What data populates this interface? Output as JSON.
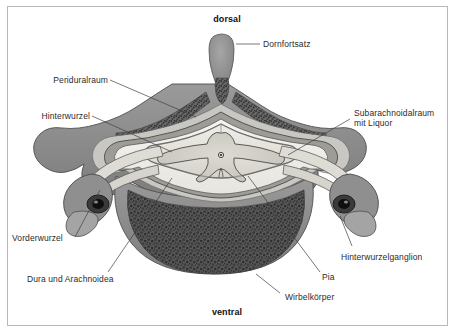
{
  "figure": {
    "type": "anatomical-cross-section",
    "frame_color": "#b8b8b8",
    "background_color": "#ffffff",
    "text_color": "#2b2b2b"
  },
  "orientation": {
    "top_label": "dorsal",
    "bottom_label": "ventral"
  },
  "labels": {
    "dornfortsatz": "Dornfortsatz",
    "periduralraum": "Periduralraum",
    "hinterwurzel": "Hinterwurzel",
    "subarachnoidalraum_line1": "Subarachnoidalraum",
    "subarachnoidalraum_line2": "mit Liquor",
    "vorderwurzel": "Vorderwurzel",
    "dura_und_arachnoidea": "Dura und Arachnoidea",
    "hinterwurzelganglion": "Hinterwurzelganglion",
    "pia": "Pia",
    "wirbelkoerper": "Wirbelkörper"
  },
  "structures": {
    "spinous_process": "Dornfortsatz",
    "vertebral_body": "Wirbelkörper",
    "dorsal_root": "Hinterwurzel",
    "ventral_root": "Vorderwurzel",
    "dorsal_root_ganglion": "Hinterwurzelganglion",
    "epidural_space": "Periduralraum",
    "subarachnoid_space": "Subarachnoidalraum mit Liquor",
    "dura_arachnoid": "Dura und Arachnoidea",
    "pia_mater": "Pia",
    "central_canal": "Zentralkanal",
    "gray_matter": "Graue Substanz",
    "white_matter": "Weisse Substanz"
  },
  "palette": {
    "bone_cortex": "#8b8b8b",
    "bone_trabecular_dark": "#4a4a4a",
    "bone_trabecular_mid": "#6e6e6e",
    "cord_white_matter": "#e4e2dc",
    "cord_gray_matter": "#d0cec6",
    "csf_space": "#efeee9",
    "dura": "#9a9a9a",
    "nerve_root": "#dcdad3",
    "ganglion_dark": "#2a2a2a",
    "leader_line": "#4a4a4a"
  }
}
